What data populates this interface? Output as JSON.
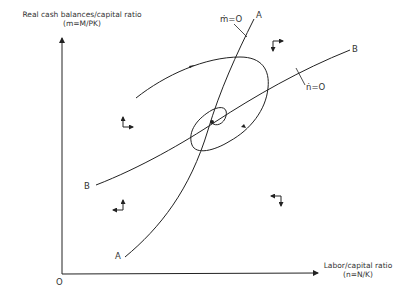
{
  "diagram": {
    "type": "phase-diagram",
    "y_axis": {
      "title": "Real cash balances/capital ratio",
      "formula": "(m=M/PK)"
    },
    "x_axis": {
      "title": "Labor/capital ratio",
      "formula": "(n=N/K)"
    },
    "origin_label": "O",
    "curves": [
      {
        "id": "A",
        "end_label_top": "A",
        "end_label_bottom": "A",
        "locus_label": "ṁ=O"
      },
      {
        "id": "B",
        "end_label_top": "B",
        "end_label_bottom": "B",
        "locus_label": "ṅ=O"
      }
    ],
    "trajectory": {
      "description": "Spiral path converging to equilibrium at intersection of loci A and B",
      "direction": "clockwise"
    },
    "direction_arrows": [
      {
        "region": "upper-left",
        "vertical": "up",
        "horizontal": "right"
      },
      {
        "region": "upper-right",
        "vertical": "down",
        "horizontal": "right"
      },
      {
        "region": "lower-left",
        "vertical": "up",
        "horizontal": "left"
      },
      {
        "region": "lower-right",
        "vertical": "down",
        "horizontal": "left"
      }
    ],
    "colors": {
      "line": "#222222",
      "background": "#ffffff"
    }
  }
}
